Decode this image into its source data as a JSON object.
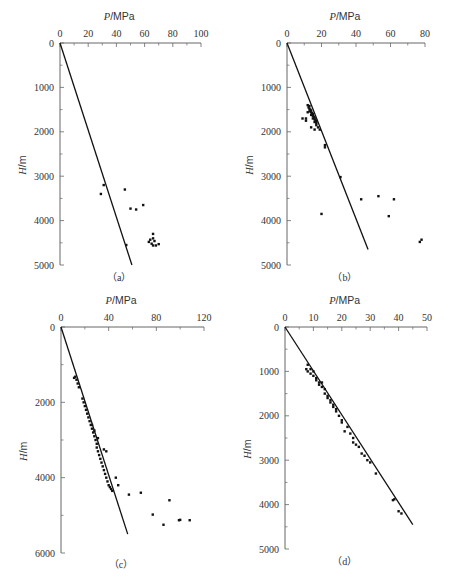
{
  "chart_data": [
    {
      "id": "a",
      "type": "scatter",
      "panel_label": "（a）",
      "xlabel": "P / MPa",
      "ylabel": "H / m",
      "xlim": [
        0,
        100
      ],
      "ylim": [
        0,
        5000
      ],
      "x_ticks": [
        0,
        20,
        40,
        60,
        80,
        100
      ],
      "y_ticks": [
        0,
        1000,
        2000,
        3000,
        4000,
        5000
      ],
      "x_axis_position": "top",
      "y_inverted": true,
      "trend_line": [
        [
          0,
          0
        ],
        [
          51,
          5000
        ]
      ],
      "points": [
        [
          31,
          3200
        ],
        [
          29,
          3400
        ],
        [
          46,
          3300
        ],
        [
          50,
          3730
        ],
        [
          54,
          3750
        ],
        [
          59,
          3650
        ],
        [
          47,
          4550
        ],
        [
          66,
          4300
        ],
        [
          64,
          4430
        ],
        [
          66,
          4400
        ],
        [
          67,
          4460
        ],
        [
          65,
          4520
        ],
        [
          66,
          4560
        ],
        [
          68,
          4560
        ],
        [
          70,
          4530
        ],
        [
          63,
          4480
        ]
      ]
    },
    {
      "id": "b",
      "type": "scatter",
      "panel_label": "（b）",
      "xlabel": "P / MPa",
      "ylabel": "H / m",
      "xlim": [
        0,
        80
      ],
      "ylim": [
        0,
        5000
      ],
      "x_ticks": [
        0,
        20,
        40,
        60,
        80
      ],
      "y_ticks": [
        0,
        1000,
        2000,
        3000,
        4000,
        5000
      ],
      "x_axis_position": "top",
      "y_inverted": true,
      "trend_line": [
        [
          0,
          0
        ],
        [
          47,
          4650
        ]
      ],
      "points": [
        [
          12,
          1400
        ],
        [
          13,
          1420
        ],
        [
          12.5,
          1450
        ],
        [
          13,
          1480
        ],
        [
          13.5,
          1500
        ],
        [
          14,
          1520
        ],
        [
          13,
          1540
        ],
        [
          14,
          1560
        ],
        [
          14.5,
          1580
        ],
        [
          15,
          1600
        ],
        [
          14,
          1620
        ],
        [
          15,
          1640
        ],
        [
          15.5,
          1660
        ],
        [
          16,
          1680
        ],
        [
          15,
          1700
        ],
        [
          16,
          1720
        ],
        [
          16.5,
          1740
        ],
        [
          17,
          1760
        ],
        [
          16,
          1780
        ],
        [
          17,
          1800
        ],
        [
          12,
          1560
        ],
        [
          11,
          1700
        ],
        [
          9,
          1700
        ],
        [
          11,
          1750
        ],
        [
          14,
          1900
        ],
        [
          16,
          1950
        ],
        [
          18,
          1900
        ],
        [
          19,
          1950
        ],
        [
          17,
          1850
        ],
        [
          22,
          2300
        ],
        [
          22,
          2350
        ],
        [
          31,
          3020
        ],
        [
          43,
          3520
        ],
        [
          53,
          3450
        ],
        [
          62,
          3520
        ],
        [
          20,
          3850
        ],
        [
          59,
          3900
        ],
        [
          77,
          4480
        ],
        [
          78,
          4430
        ]
      ]
    },
    {
      "id": "c",
      "type": "scatter",
      "panel_label": "（c）",
      "xlabel": "P / MPa",
      "ylabel": "H / m",
      "xlim": [
        0,
        120
      ],
      "ylim": [
        0,
        6000
      ],
      "x_ticks": [
        0,
        40,
        80,
        120
      ],
      "y_ticks": [
        0,
        2000,
        4000,
        6000
      ],
      "x_axis_position": "top",
      "y_inverted": true,
      "trend_line": [
        [
          0,
          0
        ],
        [
          56,
          5500
        ]
      ],
      "points": [
        [
          11,
          1350
        ],
        [
          12,
          1320
        ],
        [
          13,
          1400
        ],
        [
          14,
          1500
        ],
        [
          15,
          1600
        ],
        [
          18,
          1900
        ],
        [
          19,
          2000
        ],
        [
          20,
          2100
        ],
        [
          21,
          2200
        ],
        [
          22,
          2300
        ],
        [
          23,
          2400
        ],
        [
          24,
          2500
        ],
        [
          25,
          2600
        ],
        [
          26,
          2700
        ],
        [
          27,
          2800
        ],
        [
          28,
          2900
        ],
        [
          29,
          3000
        ],
        [
          30,
          3100
        ],
        [
          30,
          3200
        ],
        [
          31,
          3300
        ],
        [
          32,
          3400
        ],
        [
          33,
          3500
        ],
        [
          34,
          3600
        ],
        [
          35,
          3700
        ],
        [
          36,
          3800
        ],
        [
          37,
          3900
        ],
        [
          38,
          4000
        ],
        [
          39,
          4100
        ],
        [
          40,
          4200
        ],
        [
          41,
          4250
        ],
        [
          42,
          4300
        ],
        [
          43,
          4350
        ],
        [
          26,
          2600
        ],
        [
          28,
          2750
        ],
        [
          31,
          2950
        ],
        [
          36,
          3250
        ],
        [
          38,
          3300
        ],
        [
          46,
          4000
        ],
        [
          48,
          4200
        ],
        [
          57,
          4450
        ],
        [
          67,
          4400
        ],
        [
          91,
          4600
        ],
        [
          77,
          4980
        ],
        [
          86,
          5250
        ],
        [
          99,
          5130
        ],
        [
          108,
          5130
        ],
        [
          100,
          5120
        ]
      ]
    },
    {
      "id": "d",
      "type": "scatter",
      "panel_label": "（d）",
      "xlabel": "P / MPa",
      "ylabel": "H / m",
      "xlim": [
        0,
        50
      ],
      "ylim": [
        0,
        5000
      ],
      "x_ticks": [
        0,
        10,
        20,
        30,
        40,
        50
      ],
      "y_ticks": [
        0,
        1000,
        2000,
        3000,
        4000,
        5000
      ],
      "x_axis_position": "top",
      "y_inverted": true,
      "trend_line": [
        [
          0,
          0
        ],
        [
          45,
          4450
        ]
      ],
      "points": [
        [
          8,
          850
        ],
        [
          7.5,
          950
        ],
        [
          8,
          1000
        ],
        [
          9,
          950
        ],
        [
          9,
          1050
        ],
        [
          10,
          1000
        ],
        [
          10,
          1100
        ],
        [
          11,
          1150
        ],
        [
          11,
          1200
        ],
        [
          12,
          1250
        ],
        [
          12,
          1300
        ],
        [
          13,
          1250
        ],
        [
          13,
          1350
        ],
        [
          14,
          1400
        ],
        [
          14,
          1500
        ],
        [
          15,
          1550
        ],
        [
          15,
          1600
        ],
        [
          16,
          1650
        ],
        [
          16,
          1700
        ],
        [
          17,
          1750
        ],
        [
          17,
          1800
        ],
        [
          18,
          1850
        ],
        [
          18,
          1900
        ],
        [
          19,
          2000
        ],
        [
          20,
          2100
        ],
        [
          20,
          2150
        ],
        [
          21,
          2350
        ],
        [
          22,
          2250
        ],
        [
          23,
          2400
        ],
        [
          24,
          2500
        ],
        [
          24,
          2600
        ],
        [
          25,
          2650
        ],
        [
          26,
          2700
        ],
        [
          27,
          2850
        ],
        [
          28,
          2900
        ],
        [
          29,
          3000
        ],
        [
          30,
          3050
        ],
        [
          32,
          3300
        ],
        [
          38,
          3900
        ],
        [
          38.5,
          3880
        ],
        [
          40,
          4150
        ],
        [
          41,
          4200
        ]
      ]
    }
  ]
}
